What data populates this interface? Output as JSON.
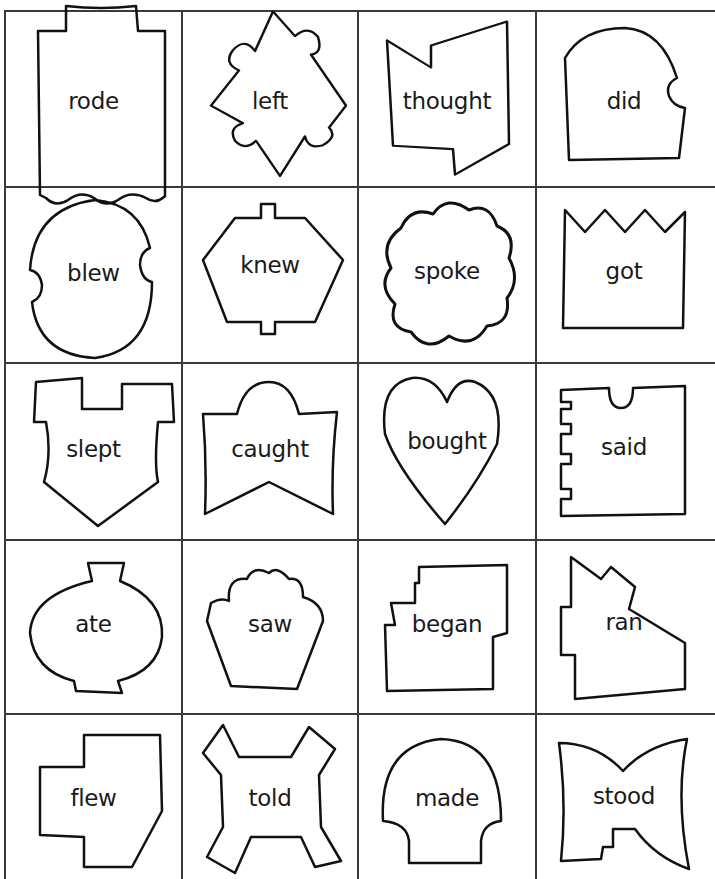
{
  "document": {
    "top_caption": "",
    "grid": {
      "columns": 4,
      "rows": 5,
      "line_color": "#3a3a3a",
      "col_x": [
        4,
        181,
        357,
        535,
        711
      ],
      "row_y": [
        10,
        186,
        362,
        539,
        713,
        879
      ]
    },
    "cards": [
      {
        "word": "rode",
        "shape": "castle-top-wavy-bottom"
      },
      {
        "word": "left",
        "shape": "scalloped-diamond"
      },
      {
        "word": "thought",
        "shape": "notched-flag"
      },
      {
        "word": "did",
        "shape": "arched-tombstone-notch"
      },
      {
        "word": "blew",
        "shape": "oval-side-notches"
      },
      {
        "word": "knew",
        "shape": "hexagon-tabs"
      },
      {
        "word": "spoke",
        "shape": "cloud"
      },
      {
        "word": "got",
        "shape": "zigzag-top-box"
      },
      {
        "word": "slept",
        "shape": "castle-shield"
      },
      {
        "word": "caught",
        "shape": "arched-banner"
      },
      {
        "word": "bought",
        "shape": "heart"
      },
      {
        "word": "said",
        "shape": "notched-box-side-teeth"
      },
      {
        "word": "ate",
        "shape": "round-vase"
      },
      {
        "word": "saw",
        "shape": "cupcake"
      },
      {
        "word": "began",
        "shape": "stepped-box"
      },
      {
        "word": "ran",
        "shape": "house-roof"
      },
      {
        "word": "flew",
        "shape": "cross-block"
      },
      {
        "word": "told",
        "shape": "x-bone"
      },
      {
        "word": "made",
        "shape": "dome-pedestal"
      },
      {
        "word": "stood",
        "shape": "bowtie-stepped"
      }
    ]
  }
}
